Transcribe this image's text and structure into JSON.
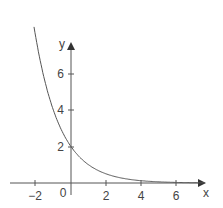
{
  "chart_data": {
    "type": "line",
    "title": "",
    "xlabel": "x",
    "ylabel": "y",
    "function": "y = 2 * 2^(-x)",
    "x_ticks": [
      -2,
      2,
      4,
      6
    ],
    "y_ticks": [
      2,
      4,
      6
    ],
    "origin_label": "0",
    "xlim": [
      -3.5,
      7.6
    ],
    "ylim": [
      -0.5,
      8.5
    ],
    "grid": false,
    "series": [
      {
        "name": "curve",
        "x": [
          -2.1,
          -2,
          -1.5,
          -1,
          -0.5,
          0,
          0.5,
          1,
          1.5,
          2,
          3,
          4,
          5,
          6,
          7
        ],
        "values": [
          8.57,
          8,
          5.66,
          4,
          2.83,
          2,
          1.41,
          1,
          0.71,
          0.5,
          0.25,
          0.125,
          0.06,
          0.03,
          0.016
        ]
      }
    ]
  },
  "labels": {
    "x_axis": "x",
    "y_axis": "y",
    "origin": "0",
    "xt_m2": "−2",
    "xt_2": "2",
    "xt_4": "4",
    "xt_6": "6",
    "yt_2": "2",
    "yt_4": "4",
    "yt_6": "6"
  }
}
